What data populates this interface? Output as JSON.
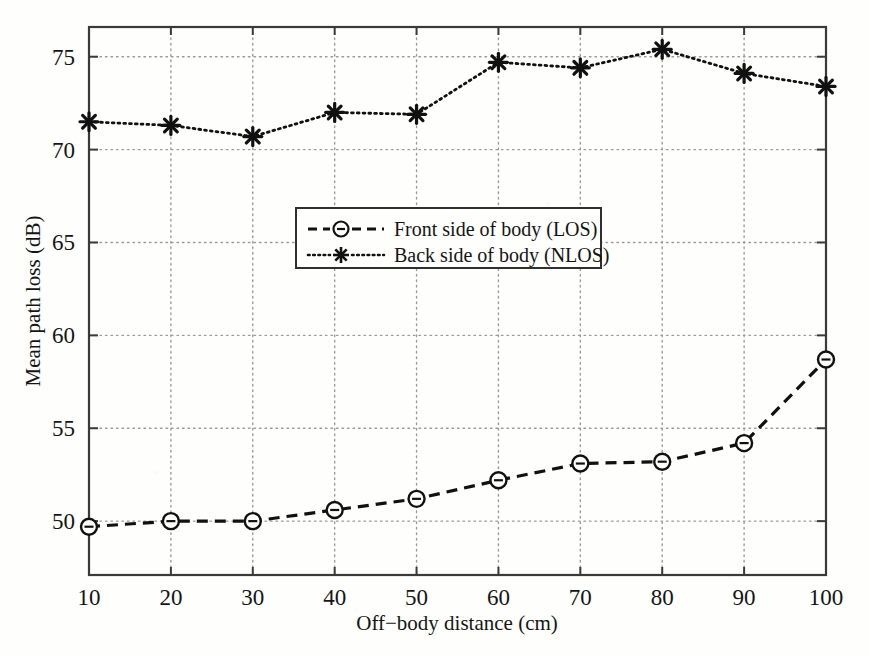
{
  "chart_data": {
    "type": "line",
    "title": "",
    "xlabel": "Off−body distance (cm)",
    "ylabel": "Mean path loss (dB)",
    "x": [
      10,
      20,
      30,
      40,
      50,
      60,
      70,
      80,
      90,
      100
    ],
    "xticks": [
      10,
      20,
      30,
      40,
      50,
      60,
      70,
      80,
      90,
      100
    ],
    "xticklabels": [
      "10",
      "20",
      "30",
      "40",
      "50",
      "60",
      "70",
      "80",
      "90",
      "100"
    ],
    "yticks": [
      50,
      55,
      60,
      65,
      70,
      75
    ],
    "yticklabels": [
      "50",
      "55",
      "60",
      "65",
      "70",
      "75"
    ],
    "xlim": [
      10,
      100
    ],
    "ylim": [
      47.1,
      76.6
    ],
    "grid": true,
    "grid_style": "dotted",
    "legend_position": "center",
    "series": [
      {
        "name": "Front side of body (LOS)",
        "values": [
          49.7,
          50.0,
          50.0,
          50.6,
          51.2,
          52.2,
          53.1,
          53.2,
          54.2,
          58.7
        ],
        "linestyle": "dashed",
        "marker": "circle",
        "color": "#111111"
      },
      {
        "name": "Back side of body (NLOS)",
        "values": [
          71.5,
          71.3,
          70.7,
          72.0,
          71.9,
          74.7,
          74.4,
          75.4,
          74.1,
          73.4
        ],
        "linestyle": "dotted",
        "marker": "asterisk",
        "color": "#111111"
      }
    ]
  },
  "legend": {
    "entries": [
      {
        "label": "Front side of body (LOS)",
        "marker": "circle-dashed-swatch"
      },
      {
        "label": "Back side of body (NLOS)",
        "marker": "asterisk-dotted-swatch"
      }
    ]
  },
  "axes": {
    "x_title": "Off−body distance (cm)",
    "y_title": "Mean path loss (dB)"
  }
}
